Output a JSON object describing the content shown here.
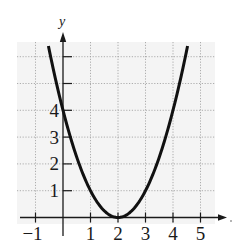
{
  "chart_data": {
    "type": "line",
    "title": "",
    "xlabel": "",
    "ylabel": "y",
    "function": "y = (x - 2)^2",
    "xlim": [
      -1.6,
      5.9
    ],
    "ylim": [
      -0.1,
      6.9
    ],
    "x_ticks": [
      -1,
      1,
      2,
      3,
      4,
      5
    ],
    "x_tick_labels": [
      "−1",
      "1",
      "2",
      "3",
      "4",
      "5"
    ],
    "y_ticks": [
      1,
      2,
      3,
      4,
      5,
      6
    ],
    "y_tick_labels": [
      "1",
      "2",
      "3",
      "4",
      "",
      ""
    ],
    "grid": true,
    "legend": null,
    "series": [
      {
        "name": "parabola",
        "x": [
          -0.53,
          -0.5,
          0,
          0.5,
          1,
          1.5,
          2,
          2.5,
          3,
          3.5,
          4,
          4.5,
          4.53
        ],
        "y": [
          6.4,
          6.25,
          4,
          2.25,
          1,
          0.25,
          0,
          0.25,
          1,
          2.25,
          4,
          6.25,
          6.4
        ],
        "color": "#111111"
      }
    ],
    "annotations": [
      {
        "text": "vertex",
        "x": 2,
        "y": 0
      }
    ]
  },
  "colors": {
    "curve": "#111111",
    "axis": "#1a1a1a",
    "grid": "#9a9a9a",
    "grid_bg": "#f4f4f4"
  }
}
